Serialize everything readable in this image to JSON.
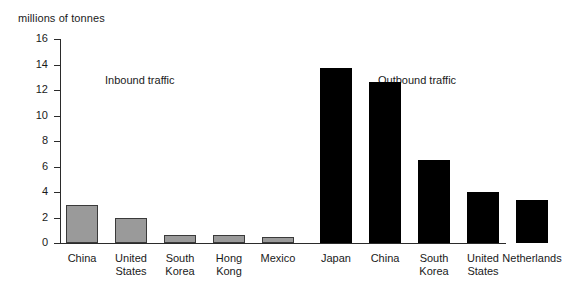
{
  "chart_data": {
    "type": "bar",
    "title": "",
    "ylabel": "millions of tonnes",
    "xlabel": "",
    "ylim": [
      0,
      16
    ],
    "yticks": [
      0,
      2,
      4,
      6,
      8,
      10,
      12,
      14,
      16
    ],
    "grid": false,
    "legend": "none",
    "annotations": [
      {
        "text": "Inbound traffic"
      },
      {
        "text": "Outbound traffic"
      }
    ],
    "groups": [
      {
        "name": "Inbound traffic",
        "color": "#9a9a9a",
        "categories": [
          "China",
          "United States",
          "South Korea",
          "Hong Kong",
          "Mexico"
        ],
        "values": [
          3.0,
          2.0,
          0.6,
          0.6,
          0.45
        ]
      },
      {
        "name": "Outbound traffic",
        "color": "#000000",
        "categories": [
          "Japan",
          "China",
          "South Korea",
          "United States",
          "Netherlands"
        ],
        "values": [
          13.7,
          12.6,
          6.5,
          4.0,
          3.4
        ]
      }
    ]
  },
  "axis": {
    "ylabel": "millions of tonnes",
    "tick_labels": [
      "16",
      "14",
      "12",
      "10",
      "8",
      "6",
      "4",
      "2",
      "0"
    ]
  },
  "annotations": {
    "inbound": "Inbound traffic",
    "outbound": "Outbound traffic"
  },
  "bars": {
    "inbound": [
      {
        "label_line1": "China",
        "label_line2": "",
        "value": 3.0
      },
      {
        "label_line1": "United",
        "label_line2": "States",
        "value": 2.0
      },
      {
        "label_line1": "South",
        "label_line2": "Korea",
        "value": 0.6
      },
      {
        "label_line1": "Hong",
        "label_line2": "Kong",
        "value": 0.6
      },
      {
        "label_line1": "Mexico",
        "label_line2": "",
        "value": 0.45
      }
    ],
    "outbound": [
      {
        "label_line1": "Japan",
        "label_line2": "",
        "value": 13.7
      },
      {
        "label_line1": "China",
        "label_line2": "",
        "value": 12.6
      },
      {
        "label_line1": "South",
        "label_line2": "Korea",
        "value": 6.5
      },
      {
        "label_line1": "United",
        "label_line2": "States",
        "value": 4.0
      },
      {
        "label_line1": "Netherlands",
        "label_line2": "",
        "value": 3.4
      }
    ]
  },
  "colors": {
    "inbound_fill": "#9a9a9a",
    "inbound_stroke": "#3a3a3a",
    "outbound_fill": "#000000",
    "axis": "#2b2b2b",
    "text": "#1a1a1a",
    "background": "#ffffff"
  }
}
